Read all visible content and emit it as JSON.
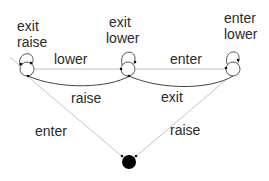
{
  "diagram": {
    "type": "state-machine",
    "states": [
      {
        "id": "left",
        "self_loop_labels": [
          "exit",
          "raise"
        ]
      },
      {
        "id": "middle",
        "self_loop_labels": [
          "exit",
          "lower"
        ]
      },
      {
        "id": "right",
        "self_loop_labels": [
          "enter",
          "lower"
        ]
      },
      {
        "id": "bottom",
        "kind": "filled-node"
      }
    ],
    "transitions": [
      {
        "from": "left",
        "to": "middle",
        "label": "lower"
      },
      {
        "from": "middle",
        "to": "right",
        "label": "enter"
      },
      {
        "from": "middle",
        "to": "left",
        "label": "raise"
      },
      {
        "from": "right",
        "to": "middle",
        "label": "exit"
      },
      {
        "from": "bottom",
        "to": "left",
        "label": "enter"
      },
      {
        "from": "bottom",
        "to": "right",
        "label": "raise"
      }
    ],
    "labels": {
      "left_loop_1": "exit",
      "left_loop_2": "raise",
      "middle_loop_1": "exit",
      "middle_loop_2": "lower",
      "right_loop_1": "enter",
      "right_loop_2": "lower",
      "left_to_middle": "lower",
      "middle_to_right": "enter",
      "middle_to_left": "raise",
      "right_to_middle": "exit",
      "bottom_to_left": "enter",
      "bottom_to_right": "raise"
    },
    "colors": {
      "line": "#b8b8b8",
      "curve": "#3a3a3a",
      "node": "#000000",
      "text": "#2a2a2a"
    }
  }
}
